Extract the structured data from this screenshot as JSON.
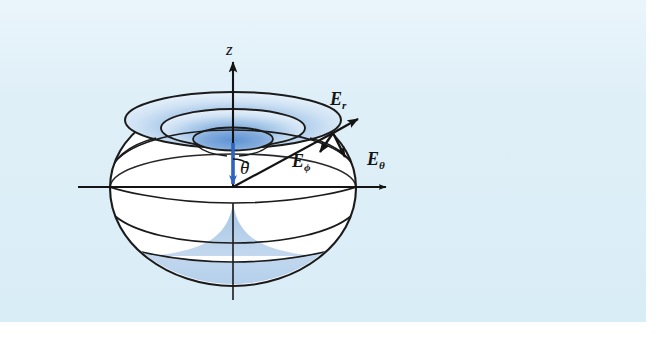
{
  "figure": {
    "background_color": "#dceef7",
    "plate_width": 646,
    "plate_height": 322
  },
  "axes": {
    "vertical": {
      "label": "z",
      "name": "z-axis",
      "arrow_direction": "up"
    },
    "horizontal": {
      "label": "",
      "name": "horizontal-axis",
      "arrow_direction": "right"
    }
  },
  "angle": {
    "label": "θ",
    "name": "polar-angle-theta"
  },
  "dipole": {
    "color": "#3a6fc4",
    "name": "dipole-moment-arrow"
  },
  "vectors": [
    {
      "id": "E_r",
      "base": "E",
      "subscript": "r",
      "name": "field-vector-E-r",
      "direction": "outward radial, up-right",
      "color": "#121212"
    },
    {
      "id": "E_phi",
      "base": "E",
      "subscript": "ϕ",
      "name": "field-vector-E-phi",
      "direction": "azimuthal, down-left",
      "color": "#121212"
    },
    {
      "id": "E_theta",
      "base": "E",
      "subscript": "θ",
      "name": "field-vector-E-theta",
      "direction": "polar, down-right",
      "color": "#121212"
    }
  ],
  "surface": {
    "outline_color": "#1a1a1a",
    "fill_color": "#ffffff",
    "shade_color": "#b8d2ea",
    "funnel_gradient_from": "#7ba7dd",
    "funnel_gradient_to": "#e9f2fb"
  }
}
